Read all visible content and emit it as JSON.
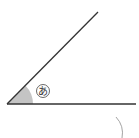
{
  "diagram": {
    "type": "angle",
    "vertex": [
      7,
      104
    ],
    "ray_top_end": [
      98,
      12
    ],
    "ray_base_end": [
      136,
      104
    ],
    "angle_label": "あ",
    "angle_fill": "#bbbbbb",
    "line_color": "#333333",
    "arc_fragment": {
      "cx": 100,
      "cy": 140,
      "r": 22
    }
  }
}
